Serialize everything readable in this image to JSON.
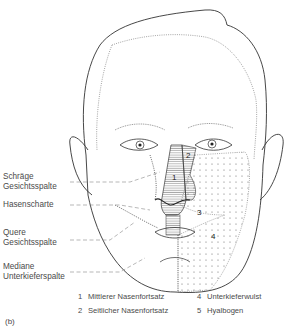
{
  "figure": {
    "panel_label": "(b)",
    "annotations": [
      {
        "id": "schraege",
        "text_line1": "Schräge",
        "text_line2": "Gesichtsspalte"
      },
      {
        "id": "hasenscharte",
        "text_line1": "Hasenscharte"
      },
      {
        "id": "quere",
        "text_line1": "Quere",
        "text_line2": "Gesichtsspalte"
      },
      {
        "id": "mediane",
        "text_line1": "Mediane",
        "text_line2": "Unterkieferspalte"
      }
    ],
    "region_numbers": [
      "1",
      "2",
      "3",
      "4"
    ],
    "legend": [
      {
        "num": "1",
        "text": "Mittlerer Nasenfortsatz"
      },
      {
        "num": "2",
        "text": "Seitlicher Nasenfortsatz"
      },
      {
        "num": "4",
        "text": "Unterkieferwulst"
      },
      {
        "num": "5",
        "text": "Hyalbogen"
      }
    ]
  }
}
